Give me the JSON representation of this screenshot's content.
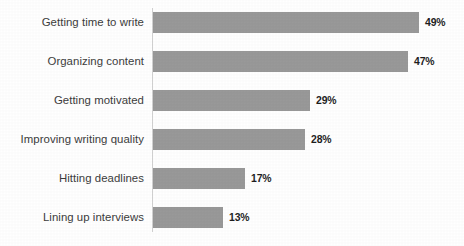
{
  "chart_data": {
    "type": "bar",
    "orientation": "horizontal",
    "title": "",
    "subtitle": "",
    "xlabel": "",
    "ylabel": "",
    "grid": false,
    "legend": false,
    "xlim": [
      0,
      49
    ],
    "categories": [
      "Getting time to write",
      "Organizing content",
      "Getting motivated",
      "Improving writing quality",
      "Hitting deadlines",
      "Lining up interviews"
    ],
    "values": [
      49,
      47,
      29,
      28,
      17,
      13
    ],
    "value_labels": [
      "49%",
      "47%",
      "29%",
      "28%",
      "17%",
      "13%"
    ],
    "series": [
      {
        "name": "Share of respondents",
        "values": [
          49,
          47,
          29,
          28,
          17,
          13
        ]
      }
    ],
    "units": "percent",
    "bar_color": "#999999",
    "label_color": "#3c3c3c",
    "value_label_color": "#1e1e1e",
    "axis_color": "#d2d2d2",
    "background": "#ffffff",
    "bars": [
      {
        "category": "Getting time to write",
        "value": 49,
        "label": "49%",
        "bar_px": 266,
        "top_px": 11
      },
      {
        "category": "Organizing content",
        "value": 47,
        "label": "47%",
        "bar_px": 255,
        "top_px": 50
      },
      {
        "category": "Getting motivated",
        "value": 29,
        "label": "29%",
        "bar_px": 157,
        "top_px": 89
      },
      {
        "category": "Improving writing quality",
        "value": 28,
        "label": "28%",
        "bar_px": 152,
        "top_px": 128
      },
      {
        "category": "Hitting deadlines",
        "value": 17,
        "label": "17%",
        "bar_px": 92,
        "top_px": 167
      },
      {
        "category": "Lining up interviews",
        "value": 13,
        "label": "13%",
        "bar_px": 70,
        "top_px": 206
      }
    ]
  }
}
